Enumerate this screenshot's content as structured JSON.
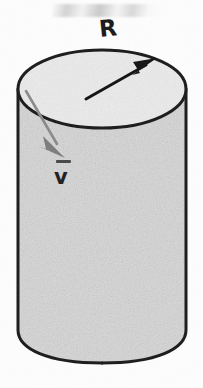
{
  "figure": {
    "kind": "cylinder-diagram",
    "caption": "",
    "background_color": "#fdfdfd",
    "canvas": {
      "width": 203,
      "height": 388
    }
  },
  "cylinder": {
    "name": "cylinder",
    "body_fill": "#d6d6d6",
    "top_fill": "#ececec",
    "outline_color": "#1c1c1c",
    "outline_width": 3,
    "top_ellipse": {
      "cx": 102,
      "cy": 89,
      "rx": 84,
      "ry": 39
    },
    "left_x": 18,
    "right_x": 186,
    "side_bottom_y": 344,
    "bottom_arc_y": 363
  },
  "labels": {
    "radius": "R",
    "velocity": "v",
    "velocity_overbar": true
  },
  "arrows": {
    "radius_arrow": {
      "name": "radius-arrow",
      "color": "#141414",
      "from": {
        "x": 86,
        "y": 99
      },
      "to": {
        "x": 155,
        "y": 60
      },
      "stroke_width": 3,
      "head_length": 19,
      "head_width": 15
    },
    "velocity_arrow": {
      "name": "velocity-arrow",
      "color": "#7d7d7d",
      "from": {
        "x": 26,
        "y": 91
      },
      "to": {
        "x": 64,
        "y": 155
      },
      "stroke_width": 2.6,
      "head_length": 18,
      "head_width": 14
    }
  },
  "colors": {
    "ink": "#1c1c1c",
    "gray_ink": "#7d7d7d",
    "paper": "#fdfdfd",
    "body_gray": "#d6d6d6",
    "top_gray": "#ececec"
  }
}
